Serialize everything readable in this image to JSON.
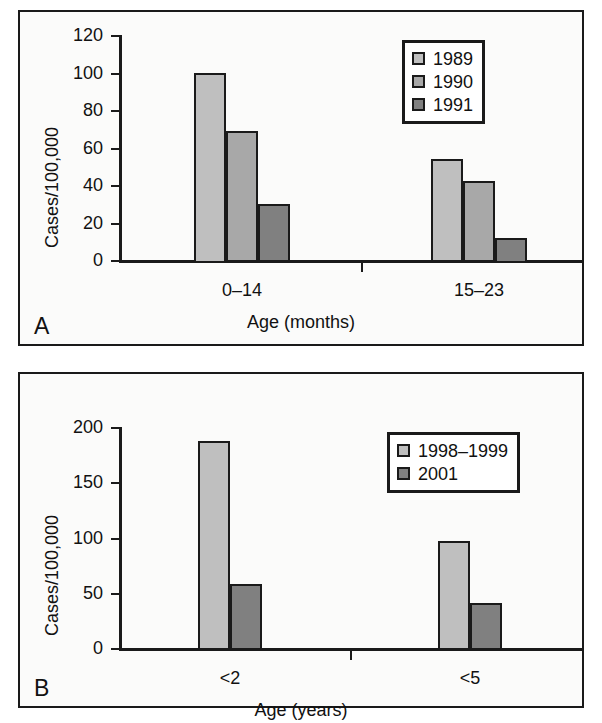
{
  "figure": {
    "background": "#ffffff",
    "panel_border_color": "#1a1a1a",
    "series_colors": {
      "light": "#bfbfbf",
      "mid": "#a8a8a8",
      "dark": "#808080"
    }
  },
  "panels": [
    {
      "letter": "A",
      "ylabel": "Cases/100,000",
      "xlabel": "Age (months)",
      "yticks": [
        "0",
        "20",
        "40",
        "60",
        "80",
        "100",
        "120"
      ],
      "categories": [
        "0–14",
        "15–23"
      ],
      "legend": [
        {
          "label": "1989",
          "shade": "light"
        },
        {
          "label": "1990",
          "shade": "mid"
        },
        {
          "label": "1991",
          "shade": "dark"
        }
      ]
    },
    {
      "letter": "B",
      "ylabel": "Cases/100,000",
      "xlabel": "Age (years)",
      "yticks": [
        "0",
        "50",
        "100",
        "150",
        "200"
      ],
      "categories": [
        "<2",
        "<5"
      ],
      "legend": [
        {
          "label": "1998–1999",
          "shade": "light"
        },
        {
          "label": "2001",
          "shade": "dark"
        }
      ]
    }
  ],
  "chart_data": [
    {
      "type": "bar",
      "panel": "A",
      "title": "",
      "xlabel": "Age (months)",
      "ylabel": "Cases/100,000",
      "categories": [
        "0–14",
        "15–23"
      ],
      "ylim": [
        0,
        120
      ],
      "ytick_values": [
        0,
        20,
        40,
        60,
        80,
        100,
        120
      ],
      "grid": false,
      "legend_position": "top-right",
      "series": [
        {
          "name": "1989",
          "values": [
            100,
            54
          ],
          "color": "#bfbfbf"
        },
        {
          "name": "1990",
          "values": [
            69,
            42
          ],
          "color": "#a8a8a8"
        },
        {
          "name": "1991",
          "values": [
            30,
            12
          ],
          "color": "#808080"
        }
      ]
    },
    {
      "type": "bar",
      "panel": "B",
      "title": "",
      "xlabel": "Age (years)",
      "ylabel": "Cases/100,000",
      "categories": [
        "<2",
        "<5"
      ],
      "ylim": [
        0,
        200
      ],
      "ytick_values": [
        0,
        50,
        100,
        150,
        200
      ],
      "grid": false,
      "legend_position": "top-right",
      "series": [
        {
          "name": "1998–1999",
          "values": [
            187,
            97
          ],
          "color": "#bfbfbf"
        },
        {
          "name": "2001",
          "values": [
            58,
            41
          ],
          "color": "#808080"
        }
      ]
    }
  ]
}
